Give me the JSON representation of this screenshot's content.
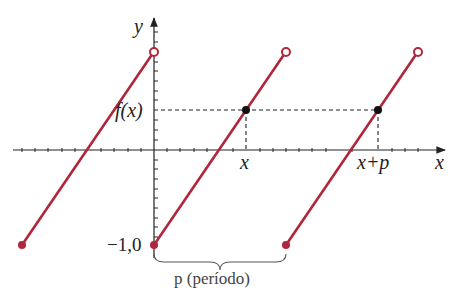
{
  "diagram": {
    "axes": {
      "x_label": "x",
      "y_label": "y",
      "y_min_label": "−1,0"
    },
    "labels": {
      "fx": "f(x)",
      "x_point": "x",
      "x_plus_p": "x+p",
      "period": "p (período)"
    },
    "colors": {
      "curve": "#b0263a",
      "axis": "#222222",
      "dashed": "#222222",
      "point": "#111111"
    },
    "segments": [
      {
        "start": [
          22,
          245
        ],
        "end": [
          154,
          52
        ],
        "start_closed": true,
        "end_open": true
      },
      {
        "start": [
          154,
          245
        ],
        "end": [
          286,
          52
        ],
        "start_closed": true,
        "end_open": true
      },
      {
        "start": [
          286,
          245
        ],
        "end": [
          418,
          52
        ],
        "start_closed": true,
        "end_open": true
      }
    ],
    "marked_points": [
      {
        "label": "(x, f(x))",
        "pos": [
          246,
          110
        ]
      },
      {
        "label": "(x+p, f(x+p))",
        "pos": [
          378,
          110
        ]
      }
    ]
  }
}
